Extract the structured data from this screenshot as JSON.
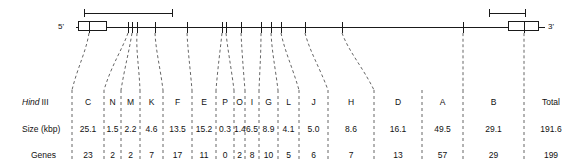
{
  "figure": {
    "type": "genome-restriction-map",
    "left_end_label": "5'",
    "right_end_label": "3'",
    "row_labels": {
      "enzyme": "Hind III",
      "enzyme_italic_part": "Hind",
      "enzyme_roman_part": "III",
      "size": "Size (kbp)",
      "genes": "Genes"
    },
    "columns": [
      {
        "fragment": "C",
        "size": "25.1",
        "genes": "23"
      },
      {
        "fragment": "N",
        "size": "1.5",
        "genes": "2"
      },
      {
        "fragment": "M",
        "size": "2.2",
        "genes": "2"
      },
      {
        "fragment": "K",
        "size": "4.6",
        "genes": "7"
      },
      {
        "fragment": "F",
        "size": "13.5",
        "genes": "17"
      },
      {
        "fragment": "E",
        "size": "15.2",
        "genes": "11"
      },
      {
        "fragment": "P",
        "size": "0.3",
        "genes": "0"
      },
      {
        "fragment": "O",
        "size": "1.4",
        "genes": "2"
      },
      {
        "fragment": "I",
        "size": "6.5",
        "genes": "8"
      },
      {
        "fragment": "G",
        "size": "8.9",
        "genes": "10"
      },
      {
        "fragment": "L",
        "size": "4.1",
        "genes": "5"
      },
      {
        "fragment": "J",
        "size": "5.0",
        "genes": "6"
      },
      {
        "fragment": "H",
        "size": "8.6",
        "genes": "7"
      },
      {
        "fragment": "D",
        "size": "16.1",
        "genes": "13"
      },
      {
        "fragment": "A",
        "size": "49.5",
        "genes": "57"
      },
      {
        "fragment": "B",
        "size": "29.1",
        "genes": "29"
      },
      {
        "fragment": "Total",
        "size": "191.6",
        "genes": "199"
      }
    ],
    "colors": {
      "line": "#1a1a1a",
      "dashed_leader": "#555555",
      "text": "#111111",
      "box_fill": "#ffffff"
    }
  }
}
